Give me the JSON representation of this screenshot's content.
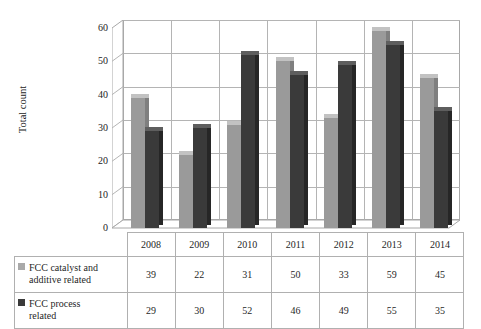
{
  "chart_data": {
    "type": "bar",
    "title": "",
    "xlabel": "",
    "ylabel": "Total count",
    "ylim": [
      0,
      60
    ],
    "y_ticks": [
      0,
      10,
      20,
      30,
      40,
      50,
      60
    ],
    "grid": true,
    "legend_position": "table-left",
    "categories": [
      "2008",
      "2009",
      "2010",
      "2011",
      "2012",
      "2013",
      "2014"
    ],
    "series": [
      {
        "name": "FCC catalyst and additive related",
        "name_line1": "FCC catalyst and",
        "name_line2": "additive related",
        "color": "#9a9a9a",
        "values": [
          39,
          22,
          31,
          50,
          33,
          59,
          45
        ]
      },
      {
        "name": "FCC process related",
        "name_line1": "FCC process",
        "name_line2": "related",
        "color": "#3a3a3a",
        "values": [
          29,
          30,
          52,
          46,
          49,
          55,
          35
        ]
      }
    ]
  },
  "axis": {
    "y_title": "Total count",
    "ticks": [
      "60",
      "50",
      "40",
      "30",
      "20",
      "10",
      "0"
    ]
  },
  "table": {
    "years": [
      "2008",
      "2009",
      "2010",
      "2011",
      "2012",
      "2013",
      "2014"
    ],
    "rows": [
      {
        "legend_line1": "FCC catalyst and",
        "legend_line2": "additive related",
        "values": [
          "39",
          "22",
          "31",
          "50",
          "33",
          "59",
          "45"
        ]
      },
      {
        "legend_line1": "FCC process",
        "legend_line2": "related",
        "values": [
          "29",
          "30",
          "52",
          "46",
          "49",
          "55",
          "35"
        ]
      }
    ]
  },
  "colors": {
    "series_a": "#9a9a9a",
    "series_b": "#3a3a3a",
    "grid": "#b4b4b4",
    "frame": "#a8a8a8"
  }
}
